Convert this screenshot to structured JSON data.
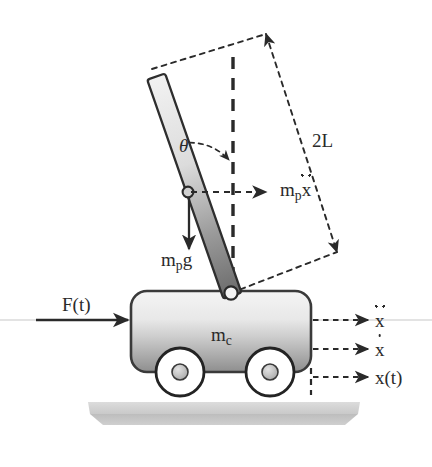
{
  "figure": {
    "type": "physics-free-body-diagram"
  },
  "colors": {
    "stroke": "#2a2a2a",
    "rod_light": "#eeeeee",
    "rod_dark": "#6e6e6e",
    "cart_light": "#f0f0f0",
    "cart_dark": "#8f8f8f",
    "ground_top": "#d6d6d6",
    "ground_front": "#b4b4b4",
    "wheel_fill": "#ffffff",
    "hub_fill": "#b9b9b9",
    "faint_line": "#d8d8d8",
    "background": "#ffffff"
  },
  "labels": {
    "theta": "θ",
    "length": "2L",
    "pendulum_inertial_force": {
      "base": "m",
      "sub": "p",
      "var": "x",
      "dots": 2
    },
    "pendulum_weight": {
      "base": "m",
      "sub": "p",
      "var": "g",
      "dots": 0
    },
    "cart_mass": {
      "base": "m",
      "sub": "c",
      "var": "",
      "dots": 0
    },
    "applied_force": "F(t)",
    "acceleration": {
      "var": "x",
      "dots": 2
    },
    "velocity": {
      "var": "x",
      "dots": 1
    },
    "position": "x(t)"
  },
  "elements": {
    "rod": {
      "name": "pendulum-rod",
      "pivot_cart": [
        231,
        293
      ],
      "pivot_mid": [
        188,
        192
      ],
      "tip": [
        152,
        69
      ]
    },
    "cart": {
      "name": "cart-body",
      "x": 131,
      "y": 291,
      "width": 180,
      "height": 81,
      "radius": 16
    },
    "wheels": [
      {
        "name": "wheel-left",
        "cx": 180,
        "cy": 372,
        "r": 24,
        "hub_r": 8
      },
      {
        "name": "wheel-right",
        "cx": 270,
        "cy": 372,
        "r": 24,
        "hub_r": 8
      }
    ],
    "ground": {
      "name": "ground-slab",
      "top_left": [
        88,
        402
      ],
      "top_right": [
        360,
        402
      ],
      "bottom_right": [
        345,
        424
      ],
      "bottom_left": [
        103,
        424
      ]
    },
    "dimension_line_2L": {
      "name": "length-dimension-2L",
      "from": [
        266,
        34
      ],
      "to": [
        337,
        252
      ]
    },
    "vertical_reference": {
      "name": "vertical-dashed-reference",
      "x": 233,
      "y_top": 57,
      "y_bottom": 291
    },
    "angle_arc": {
      "name": "theta-angle-arc",
      "center": [
        188,
        192
      ],
      "radius": 52
    }
  }
}
